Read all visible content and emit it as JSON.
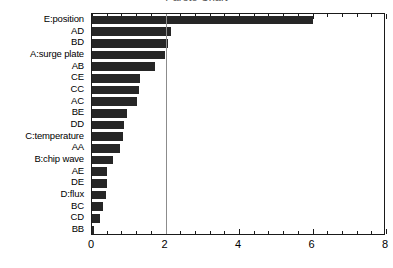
{
  "chart_data": {
    "type": "bar",
    "orientation": "horizontal",
    "title": "Pareto Chart",
    "xlabel": "",
    "ylabel": "",
    "xlim": [
      0,
      8
    ],
    "ylim": null,
    "grid": false,
    "legend": null,
    "x_ticks": [
      0,
      2,
      4,
      6,
      8
    ],
    "x_tick_labels": [
      "0",
      "2",
      "4",
      "6",
      "8"
    ],
    "x_minor_tick_step": 0.4,
    "bar_color": "#262626",
    "reference_line": {
      "value": 2.0,
      "color": "#8c8c8c",
      "orientation": "vertical"
    },
    "categories": [
      "E:position",
      "AD",
      "BD",
      "A:surge plate",
      "AB",
      "CE",
      "CC",
      "AC",
      "BE",
      "DD",
      "C:temperature",
      "AA",
      "B:chip wave",
      "AE",
      "DE",
      "D:flux",
      "BC",
      "CD",
      "BB"
    ],
    "values": [
      6.0,
      2.15,
      2.07,
      1.98,
      1.72,
      1.3,
      1.28,
      1.22,
      0.94,
      0.87,
      0.85,
      0.77,
      0.56,
      0.42,
      0.4,
      0.39,
      0.3,
      0.22,
      0.06
    ]
  }
}
